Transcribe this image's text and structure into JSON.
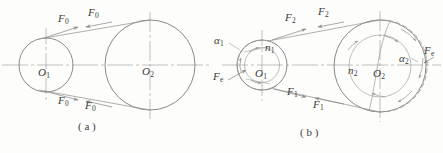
{
  "figure": {
    "background_color": "#fdfdfc",
    "line_color": "#8a8a8a",
    "axis_color": "#9a9a9a",
    "text_color": "#3b3b3b",
    "captions": [
      {
        "id": "caption-a",
        "text": "( a )",
        "x": 78,
        "y": 122
      },
      {
        "id": "caption-b",
        "text": "( b )",
        "x": 300,
        "y": 128
      }
    ],
    "panel_a": {
      "name": "panel-a-initial-forces",
      "wheels": [
        {
          "id": "wheel-o1",
          "label": "O",
          "sub": "1",
          "cx": 46,
          "cy": 65,
          "r": 27
        },
        {
          "id": "wheel-o2",
          "label": "O",
          "sub": "2",
          "cx": 150,
          "cy": 65,
          "r": 45
        }
      ],
      "force_labels": [
        {
          "id": "force-f0-upper-left",
          "symbol": "F",
          "sub": "0",
          "x": 58,
          "y": 15
        },
        {
          "id": "force-f0-upper-right",
          "symbol": "F",
          "sub": "0",
          "x": 88,
          "y": 10
        },
        {
          "id": "force-f0-lower-left",
          "symbol": "F",
          "sub": "0",
          "x": 58,
          "y": 97
        },
        {
          "id": "force-f0-lower-right",
          "symbol": "F",
          "sub": "0",
          "x": 85,
          "y": 102
        }
      ]
    },
    "panel_b": {
      "name": "panel-b-working-forces",
      "wheels": [
        {
          "id": "wheel-o1-b",
          "center_label": "O",
          "center_sub": "1",
          "speed_label": "n",
          "speed_sub": "1",
          "angle_label": "α",
          "angle_sub": "1",
          "cx": 262,
          "cy": 65,
          "r_outer": 25,
          "r_inner": 17
        },
        {
          "id": "wheel-o2-b",
          "center_label": "O",
          "center_sub": "2",
          "speed_label": "n",
          "speed_sub": "2",
          "angle_label": "α",
          "angle_sub": "2",
          "cx": 380,
          "cy": 66,
          "r_outer": 46,
          "r_inner": 31
        }
      ],
      "force_labels": [
        {
          "id": "force-f2-left",
          "symbol": "F",
          "sub": "2",
          "x": 285,
          "y": 14
        },
        {
          "id": "force-f2-right",
          "symbol": "F",
          "sub": "2",
          "x": 318,
          "y": 9
        },
        {
          "id": "force-f1-left",
          "symbol": "F",
          "sub": "1",
          "x": 287,
          "y": 88
        },
        {
          "id": "force-f1-right",
          "symbol": "F",
          "sub": "1",
          "x": 313,
          "y": 101
        },
        {
          "id": "force-fe-left",
          "symbol": "F",
          "sub": "e",
          "x": 214,
          "y": 73
        },
        {
          "id": "force-fe-right",
          "symbol": "F",
          "sub": "e",
          "x": 424,
          "y": 47
        }
      ],
      "alpha_labels": [
        {
          "id": "alpha-1",
          "symbol": "α",
          "sub": "1",
          "x": 215,
          "y": 37
        },
        {
          "id": "alpha-2",
          "symbol": "α",
          "sub": "2",
          "x": 400,
          "y": 55
        }
      ],
      "speed_labels": [
        {
          "id": "speed-n1",
          "symbol": "n",
          "sub": "1",
          "x": 265,
          "y": 44
        },
        {
          "id": "speed-n2",
          "symbol": "n",
          "sub": "2",
          "x": 348,
          "y": 67
        }
      ]
    }
  }
}
